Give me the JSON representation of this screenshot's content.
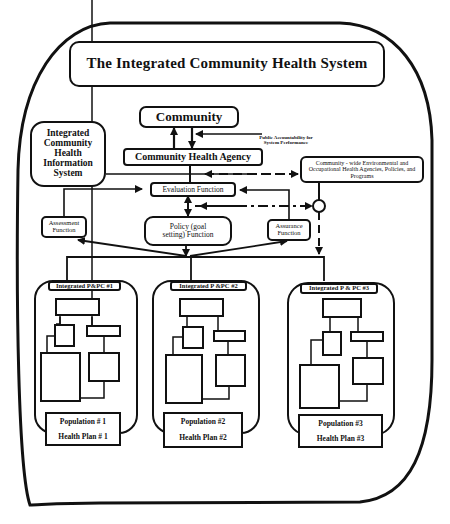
{
  "diagram": {
    "title": "The Integrated Community Health System",
    "community": "Community",
    "community_health_agency": "Community Health Agency",
    "public_accountability": "Public Accountability for System Performance",
    "information_system": "Integrated Community Health Information System",
    "environmental_agencies": "Community - wide Environmental and Occupational Health Agencies, Policies, and Programs",
    "evaluation": "Evaluation Function",
    "assessment": "Assessment Function",
    "policy": "Policy (goal setting) Function",
    "assurance": "Assurance Function",
    "plans": [
      {
        "header": "Integrated P&PC #1",
        "population": "Population # 1",
        "health_plan": "Health Plan # 1"
      },
      {
        "header": "Integrated P &PC #2",
        "population": "Population #2",
        "health_plan": "Health Plan #2"
      },
      {
        "header": "Integrated P & PC #3",
        "population": "Population #3",
        "health_plan": "Health Plan #3"
      }
    ],
    "colors": {
      "ink": "#111111",
      "paper": "#ffffff"
    }
  }
}
